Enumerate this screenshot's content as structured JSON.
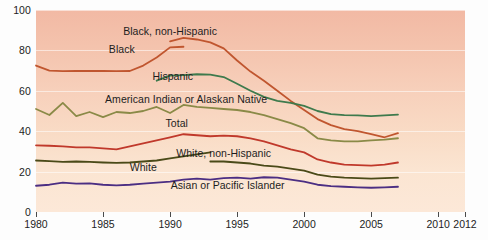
{
  "chart_data": {
    "type": "line",
    "title": "",
    "subtitle": "",
    "xlabel": "",
    "ylabel": "",
    "xlim": [
      1980,
      2012
    ],
    "ylim": [
      0,
      100
    ],
    "grid": true,
    "legend_position": "inline-labels",
    "y_ticks": [
      0,
      20,
      40,
      60,
      80,
      100
    ],
    "x_ticks": [
      1980,
      1985,
      1990,
      1995,
      2000,
      2005,
      2010,
      2012
    ],
    "x_tick_labels": [
      "1980",
      "1985",
      "1990",
      "1995",
      "2000",
      "2005",
      "2010",
      "2012"
    ],
    "y_tick_labels": [
      "0",
      "20",
      "40",
      "60",
      "80",
      "100"
    ],
    "background": {
      "top_color": "#f2b9a4",
      "bottom_color": "#fce8d8",
      "gridline_color": "#ffffff"
    },
    "series": [
      {
        "name": "Black",
        "label": "Black",
        "color": "#c0562f",
        "label_x": 1986.4,
        "label_y": 80.5,
        "x": [
          1980,
          1981,
          1982,
          1983,
          1984,
          1985,
          1986,
          1987,
          1988,
          1989,
          1990,
          1991
        ],
        "values": [
          72.5,
          70.0,
          69.7,
          69.8,
          69.9,
          69.8,
          69.7,
          69.8,
          72.5,
          76.5,
          81.5,
          81.8
        ]
      },
      {
        "name": "Black, non-Hispanic",
        "label": "Black, non-Hispanic",
        "color": "#c0562f",
        "label_x": 1990.0,
        "label_y": 89.5,
        "x": [
          1990,
          1991,
          1992,
          1993,
          1994,
          1995,
          1996,
          1997,
          1998,
          1999,
          2000,
          2001,
          2002,
          2003,
          2004,
          2005,
          2006,
          2007
        ],
        "values": [
          84.5,
          86.2,
          85.4,
          84.0,
          81.0,
          75.0,
          69.5,
          65.0,
          60.0,
          55.0,
          50.5,
          46.0,
          43.0,
          41.0,
          40.0,
          38.5,
          37.0,
          39.0
        ]
      },
      {
        "name": "Hispanic",
        "label": "Hispanic",
        "color": "#3e7a4c",
        "label_x": 1990.2,
        "label_y": 67.5,
        "x": [
          1989,
          1990,
          1991,
          1992,
          1993,
          1994,
          1995,
          1996,
          1997,
          1998,
          1999,
          2000,
          2001,
          2002,
          2003,
          2004,
          2005,
          2006,
          2007
        ],
        "values": [
          65.0,
          67.5,
          67.8,
          68.2,
          68.0,
          66.8,
          63.5,
          60.0,
          57.0,
          55.0,
          54.0,
          52.5,
          50.0,
          48.5,
          48.0,
          47.8,
          47.5,
          47.8,
          48.2
        ]
      },
      {
        "name": "American Indian or Alaskan Native",
        "label": "American Indian or Alaskan Native",
        "color": "#8a8a47",
        "label_x": 1991.2,
        "label_y": 56.0,
        "x": [
          1980,
          1981,
          1982,
          1983,
          1984,
          1985,
          1986,
          1987,
          1988,
          1989,
          1990,
          1991,
          1992,
          1993,
          1994,
          1995,
          1996,
          1997,
          1998,
          1999,
          2000,
          2001,
          2002,
          2003,
          2004,
          2005,
          2006,
          2007
        ],
        "values": [
          51.0,
          48.0,
          54.0,
          47.5,
          49.5,
          47.0,
          49.5,
          49.0,
          50.0,
          52.0,
          49.0,
          53.0,
          52.0,
          51.5,
          51.0,
          50.5,
          49.5,
          48.0,
          46.0,
          44.0,
          41.5,
          36.5,
          35.5,
          35.0,
          35.0,
          35.5,
          35.8,
          36.5
        ]
      },
      {
        "name": "Total",
        "label": "Total",
        "color": "#c0392b",
        "label_x": 1990.5,
        "label_y": 44.0,
        "x": [
          1980,
          1981,
          1982,
          1983,
          1984,
          1985,
          1986,
          1987,
          1988,
          1989,
          1990,
          1991,
          1992,
          1993,
          1994,
          1995,
          1996,
          1997,
          1998,
          1999,
          2000,
          2001,
          2002,
          2003,
          2004,
          2005,
          2006,
          2007
        ],
        "values": [
          33.0,
          32.8,
          32.5,
          32.0,
          32.0,
          31.5,
          31.0,
          32.5,
          34.0,
          35.5,
          37.0,
          38.5,
          38.0,
          37.5,
          37.8,
          37.5,
          36.5,
          35.0,
          33.0,
          31.0,
          29.5,
          26.0,
          24.5,
          23.5,
          23.2,
          23.0,
          23.5,
          24.5
        ]
      },
      {
        "name": "White, non-Hispanic",
        "label": "White, non-Hispanic",
        "color": "#4a4a18",
        "label_x": 1994.0,
        "label_y": 29.0,
        "x": [
          1993,
          1994,
          1995,
          1996,
          1997,
          1998,
          1999,
          2000,
          2001,
          2002,
          2003,
          2004,
          2005,
          2006,
          2007
        ],
        "values": [
          25.0,
          25.0,
          24.5,
          24.0,
          23.0,
          22.5,
          21.5,
          20.5,
          18.5,
          17.5,
          17.0,
          16.8,
          16.5,
          16.8,
          17.0
        ]
      },
      {
        "name": "White",
        "label": "White",
        "color": "#4a4a18",
        "label_x": 1988.0,
        "label_y": 22.5,
        "x": [
          1980,
          1981,
          1982,
          1983,
          1984,
          1985,
          1986,
          1987,
          1988,
          1989,
          1990,
          1991,
          1992,
          1993
        ],
        "values": [
          25.5,
          25.2,
          24.8,
          25.0,
          24.8,
          24.5,
          24.3,
          24.5,
          25.0,
          25.5,
          26.5,
          27.5,
          28.5,
          29.5
        ]
      },
      {
        "name": "Asian or Pacific Islander",
        "label": "Asian or Pacific Islander",
        "color": "#4b2e83",
        "label_x": 1994.3,
        "label_y": 13.5,
        "x": [
          1980,
          1981,
          1982,
          1983,
          1984,
          1985,
          1986,
          1987,
          1988,
          1989,
          1990,
          1991,
          1992,
          1993,
          1994,
          1995,
          1996,
          1997,
          1998,
          1999,
          2000,
          2001,
          2002,
          2003,
          2004,
          2005,
          2006,
          2007
        ],
        "values": [
          13.0,
          13.5,
          14.5,
          14.0,
          14.2,
          13.5,
          13.2,
          13.5,
          14.0,
          14.5,
          15.0,
          16.0,
          16.5,
          16.0,
          16.8,
          17.0,
          16.5,
          17.2,
          17.0,
          16.0,
          15.0,
          13.5,
          12.8,
          12.5,
          12.2,
          12.0,
          12.2,
          12.5
        ]
      }
    ]
  }
}
